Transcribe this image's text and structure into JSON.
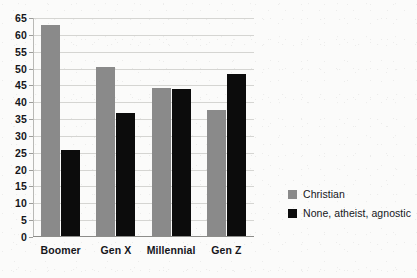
{
  "chart_data": {
    "type": "bar",
    "title": "",
    "subtitle": "",
    "xlabel": "",
    "ylabel": "",
    "categories": [
      "Boomer",
      "Gen X",
      "Millennial",
      "Gen Z"
    ],
    "series": [
      {
        "name": "Christian",
        "color": "#8a8a8a",
        "values": [
          62.5,
          50.3,
          43.8,
          37.3
        ]
      },
      {
        "name": "None, atheist, agnostic",
        "color": "#0c0c0c",
        "values": [
          25.5,
          36.5,
          43.5,
          48.0
        ]
      }
    ],
    "ylim": [
      0,
      65
    ],
    "ytick_step": 5,
    "ytick_labels": [
      "65",
      "60",
      "55",
      "50",
      "45",
      "40",
      "35",
      "30",
      "25",
      "20",
      "15",
      "10",
      "5",
      "0"
    ],
    "grid": true,
    "grid_axis": "y",
    "legend_position": "right",
    "legend": [
      {
        "label": "Christian",
        "swatch": "#8a8a8a"
      },
      {
        "label": "None, atheist, agnostic",
        "swatch": "#0c0c0c"
      }
    ]
  }
}
